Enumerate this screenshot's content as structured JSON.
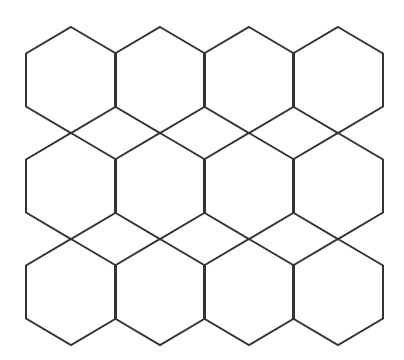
{
  "figure": {
    "type": "hexagon-tiling",
    "rows": 3,
    "cols": 4,
    "stroke_color": "#333333",
    "background": "#ffffff",
    "hexagon": {
      "orientation": "pointy-top",
      "half_width": 45,
      "vertical_radius": 53
    },
    "column_centers_x": [
      71,
      160,
      249,
      338
    ],
    "row_centers_y": [
      80,
      186,
      292
    ]
  }
}
